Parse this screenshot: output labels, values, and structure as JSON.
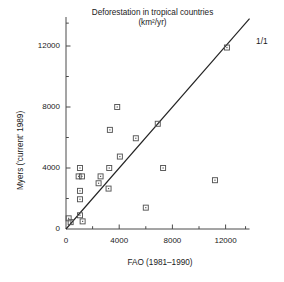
{
  "chart_data": {
    "type": "scatter",
    "title": "Deforestation in tropical countries",
    "subtitle": "(km²/yr)",
    "xlabel": "FAO (1981–1990)",
    "ylabel": "Myers ('current' 1989)",
    "xlim": [
      0,
      13800
    ],
    "ylim": [
      0,
      13900
    ],
    "xticks": [
      0,
      4000,
      8000,
      12000
    ],
    "xticklabels": [
      "0",
      "4000",
      "8000",
      "12000"
    ],
    "yticks": [
      0,
      4000,
      8000,
      12000
    ],
    "yticklabels": [
      "0",
      "4000",
      "8000",
      "12000"
    ],
    "xminorticks": [
      2000,
      6000,
      10000,
      13500
    ],
    "yminorticks": [
      2000,
      6000,
      10000,
      13500
    ],
    "grid": false,
    "legend": null,
    "marker": "open-square-with-dot",
    "marker_color": "#555555",
    "reference_line": {
      "label": "1/1",
      "slope": 1,
      "intercept": 0,
      "color": "#222222"
    },
    "points": [
      {
        "x": 200,
        "y": 700
      },
      {
        "x": 350,
        "y": 450
      },
      {
        "x": 1050,
        "y": 900
      },
      {
        "x": 1250,
        "y": 500
      },
      {
        "x": 1050,
        "y": 4000
      },
      {
        "x": 950,
        "y": 3450
      },
      {
        "x": 1200,
        "y": 3450
      },
      {
        "x": 1050,
        "y": 2500
      },
      {
        "x": 1050,
        "y": 1950
      },
      {
        "x": 2450,
        "y": 3000
      },
      {
        "x": 2600,
        "y": 3450
      },
      {
        "x": 3200,
        "y": 2650
      },
      {
        "x": 3250,
        "y": 4000
      },
      {
        "x": 3300,
        "y": 6500
      },
      {
        "x": 3850,
        "y": 8000
      },
      {
        "x": 4050,
        "y": 4750
      },
      {
        "x": 5250,
        "y": 5950
      },
      {
        "x": 6000,
        "y": 1400
      },
      {
        "x": 6900,
        "y": 6900
      },
      {
        "x": 7300,
        "y": 4000
      },
      {
        "x": 11200,
        "y": 3200
      },
      {
        "x": 12100,
        "y": 11900
      }
    ]
  }
}
